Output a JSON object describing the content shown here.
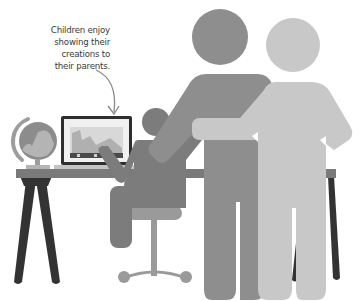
{
  "illustration": {
    "caption": {
      "lines": [
        "Children enjoy",
        "showing their",
        "creations to",
        "their parents."
      ]
    },
    "colors": {
      "background": "#ffffff",
      "caption_text": "#3a3a3a",
      "arrow": "#8a8a8a",
      "parent_dark": "#8e8e8e",
      "parent_light": "#c8c8c8",
      "child": "#7c7c7c",
      "desk_top": "#7a7a7a",
      "desk_legs": "#333333",
      "chair": "#9a9a9a",
      "globe": "#8c8c8c",
      "globe_stand": "#9d9d9d",
      "laptop_frame": "#2e2e2e",
      "laptop_screen": "#f0f0f0"
    },
    "elements": {
      "globe": "globe-icon",
      "laptop": "laptop-icon",
      "child": "child-figure",
      "chair": "chair-icon",
      "parent_left": "parent-figure",
      "parent_right": "parent-figure",
      "desk": "desk-icon",
      "arrow": "arrow-icon"
    }
  }
}
